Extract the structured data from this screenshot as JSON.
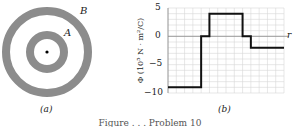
{
  "figure_a": {
    "label_outer": "B",
    "label_inner": "A",
    "caption": "(a)",
    "colors": {
      "shell": "#8c8c8c",
      "background": "#ffffff",
      "charge": "#000000"
    }
  },
  "figure_b": {
    "caption": "(b)",
    "ylabel": "Φ (10⁵ N · m²/C)",
    "xlabel": "r",
    "yticks": [
      "5",
      "0",
      "−5",
      "−10"
    ]
  },
  "figure_caption": "Figure . . . Problem 10",
  "chart_data": {
    "type": "line",
    "title": "",
    "xlabel": "r",
    "ylabel": "Φ (10^5 N·m²/C)",
    "ylim": [
      -10,
      5
    ],
    "yticks": [
      5,
      0,
      -5,
      -10
    ],
    "grid": true,
    "step": true,
    "x_grid_units": 14,
    "series": [
      {
        "name": "Φ",
        "x": [
          0,
          4,
          4,
          5,
          5,
          9,
          9,
          10,
          10,
          14
        ],
        "values": [
          -9,
          -9,
          0,
          0,
          4,
          4,
          0,
          0,
          -2,
          -2
        ]
      }
    ]
  }
}
